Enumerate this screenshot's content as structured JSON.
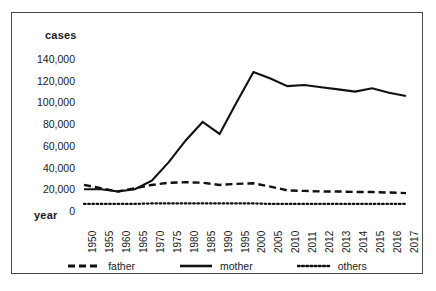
{
  "axis_titles": {
    "y": "cases",
    "x": "year"
  },
  "legend": {
    "items": [
      {
        "label": "father",
        "style": "dashed",
        "color": "#111111"
      },
      {
        "label": "mother",
        "style": "solid",
        "color": "#111111"
      },
      {
        "label": "others",
        "style": "dotted",
        "color": "#111111"
      }
    ]
  },
  "colors": {
    "line": "#111111",
    "frame": "#4a4a4a",
    "background": "#ffffff",
    "text": "#1a1a1a"
  },
  "chart_data": {
    "type": "line",
    "title": "",
    "xlabel": "year",
    "ylabel": "cases",
    "ylim": [
      0,
      140000
    ],
    "yticks": [
      0,
      20000,
      40000,
      60000,
      80000,
      100000,
      120000,
      140000
    ],
    "ytick_labels": [
      "0",
      "20,000",
      "40,000",
      "60,000",
      "80,000",
      "100,000",
      "120,000",
      "140,000"
    ],
    "grid": false,
    "legend_position": "bottom",
    "categories": [
      "1950",
      "1955",
      "1960",
      "1965",
      "1970",
      "1975",
      "1980",
      "1985",
      "1990",
      "1995",
      "2000",
      "2005",
      "2010",
      "2011",
      "2012",
      "2013",
      "2014",
      "2015",
      "2016",
      "2017"
    ],
    "series": [
      {
        "name": "father",
        "style": "dashed",
        "values": [
          24000,
          21000,
          18000,
          21000,
          24000,
          26000,
          26500,
          26000,
          24000,
          25000,
          25500,
          22500,
          19000,
          18500,
          18000,
          18000,
          17500,
          17500,
          17000,
          16500
        ]
      },
      {
        "name": "mother",
        "style": "solid",
        "values": [
          20000,
          20000,
          18000,
          20000,
          28000,
          45000,
          65000,
          82000,
          71000,
          100000,
          128000,
          122000,
          115000,
          116000,
          114000,
          112000,
          110000,
          113000,
          109000,
          106000
        ]
      },
      {
        "name": "others",
        "style": "dotted",
        "values": [
          6500,
          6500,
          6500,
          6500,
          7000,
          7000,
          7000,
          7000,
          7000,
          7000,
          7000,
          6500,
          6500,
          6500,
          6500,
          6500,
          6500,
          6500,
          6500,
          6500
        ]
      }
    ]
  }
}
